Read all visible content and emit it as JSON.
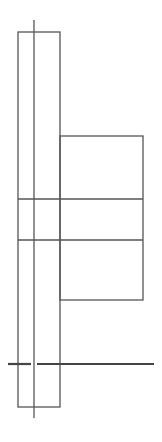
{
  "diagram": {
    "stroke_color": "#555555",
    "ground_color": "#444444",
    "background": "#ffffff",
    "elements": [
      {
        "name": "tall-rect",
        "x": 18,
        "y": 32,
        "w": 42,
        "h": 375
      },
      {
        "name": "center-line",
        "x1": 34,
        "y1": 20,
        "x2": 34,
        "y2": 418
      },
      {
        "name": "side-rect",
        "x": 60,
        "y": 136,
        "w": 83,
        "h": 164
      },
      {
        "name": "band-line-1",
        "x1": 18,
        "y1": 199,
        "x2": 143,
        "y2": 199
      },
      {
        "name": "band-line-2",
        "x1": 18,
        "y1": 240,
        "x2": 143,
        "y2": 240
      },
      {
        "name": "ground-line",
        "x1": 8,
        "y1": 364,
        "x2": 154,
        "y2": 364
      }
    ]
  }
}
